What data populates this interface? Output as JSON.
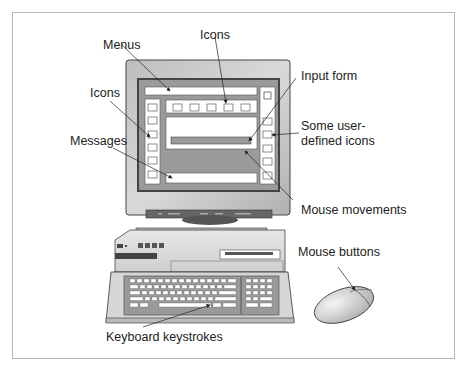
{
  "diagram": {
    "type": "annotated-illustration",
    "labels": {
      "menus": "Menus",
      "icons_top": "Icons",
      "icons_left": "Icons",
      "input_form": "Input form",
      "user_icons_line1": "Some user-",
      "user_icons_line2": "defined icons",
      "messages": "Messages",
      "mouse_movements": "Mouse movements",
      "mouse_buttons": "Mouse buttons",
      "keyboard_keystrokes": "Keyboard keystrokes"
    },
    "components": [
      "monitor",
      "screen",
      "menu-bar",
      "top-icon-bar",
      "left-icon-column",
      "right-icon-column",
      "input-form",
      "message-bar",
      "system-unit",
      "keyboard",
      "mouse"
    ],
    "colors": {
      "screen_gray": "#9a9a9a",
      "bezel_gray": "#c8c8c8",
      "panel_white": "#ffffff",
      "outline": "#333333",
      "text": "#222222",
      "frame": "#b8b8b8"
    }
  }
}
